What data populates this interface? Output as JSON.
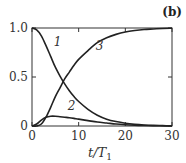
{
  "panel_label": "(b)",
  "chart_data": {
    "type": "line",
    "title": "",
    "xlabel": "t/T1",
    "xlabel_main": "t/T",
    "xlabel_sub": "1",
    "ylabel": "",
    "xlim": [
      0,
      30
    ],
    "ylim": [
      0,
      1.0
    ],
    "x_ticks": [
      0,
      10,
      20,
      30
    ],
    "x_tick_labels": [
      "0",
      "10",
      "20",
      "30"
    ],
    "y_ticks": [
      0,
      0.5,
      1.0
    ],
    "y_tick_labels": [
      "0",
      "0.5",
      "1.0"
    ],
    "grid": false,
    "legend": "none (inline curve labels)",
    "x": [
      0,
      1,
      2,
      3,
      4,
      5,
      6,
      7,
      8,
      9,
      10,
      12,
      14,
      16,
      18,
      20,
      22,
      24,
      26,
      28,
      30
    ],
    "series": [
      {
        "name": "1",
        "values": [
          1.0,
          0.98,
          0.92,
          0.82,
          0.71,
          0.6,
          0.51,
          0.43,
          0.36,
          0.3,
          0.25,
          0.17,
          0.11,
          0.07,
          0.045,
          0.028,
          0.017,
          0.01,
          0.006,
          0.004,
          0.002
        ]
      },
      {
        "name": "2",
        "values": [
          0.0,
          0.02,
          0.06,
          0.09,
          0.1,
          0.1,
          0.095,
          0.09,
          0.085,
          0.078,
          0.07,
          0.055,
          0.04,
          0.03,
          0.02,
          0.013,
          0.008,
          0.005,
          0.003,
          0.002,
          0.001
        ]
      },
      {
        "name": "3",
        "values": [
          0.0,
          0.0,
          0.02,
          0.09,
          0.19,
          0.3,
          0.39,
          0.48,
          0.55,
          0.62,
          0.68,
          0.77,
          0.85,
          0.9,
          0.935,
          0.96,
          0.975,
          0.985,
          0.99,
          0.995,
          0.997
        ]
      }
    ],
    "annotations": [
      {
        "text": "1",
        "x": 5.5,
        "y": 0.82
      },
      {
        "text": "2",
        "x": 8.5,
        "y": 0.16
      },
      {
        "text": "3",
        "x": 14.5,
        "y": 0.78
      }
    ]
  }
}
